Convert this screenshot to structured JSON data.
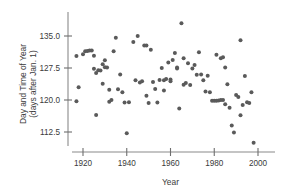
{
  "chart_data": {
    "type": "scatter",
    "title": "",
    "xlabel": "Year",
    "ylabel": "Day and Time of Year (days after Jan. 1)",
    "ylabel_line1": "Day and Time of Year",
    "ylabel_line2": "(days after Jan. 1)",
    "xlim": [
      1916,
      2001
    ],
    "ylim": [
      108.5,
      138.5
    ],
    "grid": false,
    "legend": null,
    "xticks": [
      1920,
      1940,
      1960,
      1980,
      2000
    ],
    "xtick_labels": [
      "1920",
      "1940",
      "1960",
      "1980",
      "2000"
    ],
    "yticks": [
      112.5,
      120.0,
      127.5,
      135.0
    ],
    "ytick_labels": [
      "112.5",
      "120.0",
      "127.5",
      "135.0"
    ],
    "marker": "circle",
    "marker_color": "#5a5a5a",
    "marker_size": 2.0,
    "points": [
      {
        "x": 1917,
        "y": 130.3
      },
      {
        "x": 1917,
        "y": 119.7
      },
      {
        "x": 1918,
        "y": 123.0
      },
      {
        "x": 1920,
        "y": 130.7
      },
      {
        "x": 1921,
        "y": 131.4
      },
      {
        "x": 1922,
        "y": 131.5
      },
      {
        "x": 1923,
        "y": 131.6
      },
      {
        "x": 1924,
        "y": 131.6
      },
      {
        "x": 1925,
        "y": 130.4
      },
      {
        "x": 1925,
        "y": 127.3
      },
      {
        "x": 1926,
        "y": 126.3
      },
      {
        "x": 1926,
        "y": 116.5
      },
      {
        "x": 1927,
        "y": 127.0
      },
      {
        "x": 1928,
        "y": 126.9
      },
      {
        "x": 1929,
        "y": 128.4
      },
      {
        "x": 1929,
        "y": 123.8
      },
      {
        "x": 1930,
        "y": 129.3
      },
      {
        "x": 1930,
        "y": 127.7
      },
      {
        "x": 1931,
        "y": 127.6
      },
      {
        "x": 1932,
        "y": 122.4
      },
      {
        "x": 1932,
        "y": 119.6
      },
      {
        "x": 1933,
        "y": 120.0
      },
      {
        "x": 1934,
        "y": 131.4
      },
      {
        "x": 1935,
        "y": 134.6
      },
      {
        "x": 1936,
        "y": 122.5
      },
      {
        "x": 1937,
        "y": 126.0
      },
      {
        "x": 1938,
        "y": 121.8
      },
      {
        "x": 1939,
        "y": 119.4
      },
      {
        "x": 1940,
        "y": 112.2
      },
      {
        "x": 1941,
        "y": 119.5
      },
      {
        "x": 1943,
        "y": 133.6
      },
      {
        "x": 1944,
        "y": 124.6
      },
      {
        "x": 1945,
        "y": 135.0
      },
      {
        "x": 1946,
        "y": 124.1
      },
      {
        "x": 1947,
        "y": 124.4
      },
      {
        "x": 1948,
        "y": 132.8
      },
      {
        "x": 1949,
        "y": 132.8
      },
      {
        "x": 1949,
        "y": 121.0
      },
      {
        "x": 1950,
        "y": 119.3
      },
      {
        "x": 1951,
        "y": 131.8
      },
      {
        "x": 1952,
        "y": 124.2
      },
      {
        "x": 1953,
        "y": 122.6
      },
      {
        "x": 1954,
        "y": 119.4
      },
      {
        "x": 1955,
        "y": 124.7
      },
      {
        "x": 1956,
        "y": 127.5
      },
      {
        "x": 1957,
        "y": 124.6
      },
      {
        "x": 1957,
        "y": 122.2
      },
      {
        "x": 1958,
        "y": 124.9
      },
      {
        "x": 1959,
        "y": 128.8
      },
      {
        "x": 1960,
        "y": 124.8
      },
      {
        "x": 1960,
        "y": 124.4
      },
      {
        "x": 1961,
        "y": 129.4
      },
      {
        "x": 1962,
        "y": 131.0
      },
      {
        "x": 1963,
        "y": 127.6
      },
      {
        "x": 1963,
        "y": 127.4
      },
      {
        "x": 1964,
        "y": 118.0
      },
      {
        "x": 1965,
        "y": 138.0
      },
      {
        "x": 1966,
        "y": 129.8
      },
      {
        "x": 1966,
        "y": 123.6
      },
      {
        "x": 1967,
        "y": 124.0
      },
      {
        "x": 1968,
        "y": 128.6
      },
      {
        "x": 1969,
        "y": 123.5
      },
      {
        "x": 1970,
        "y": 127.4
      },
      {
        "x": 1971,
        "y": 128.2
      },
      {
        "x": 1972,
        "y": 125.9
      },
      {
        "x": 1973,
        "y": 131.2
      },
      {
        "x": 1974,
        "y": 126.0
      },
      {
        "x": 1975,
        "y": 124.6
      },
      {
        "x": 1976,
        "y": 122.0
      },
      {
        "x": 1977,
        "y": 125.7
      },
      {
        "x": 1978,
        "y": 121.8
      },
      {
        "x": 1979,
        "y": 119.8
      },
      {
        "x": 1980,
        "y": 119.8
      },
      {
        "x": 1981,
        "y": 119.8
      },
      {
        "x": 1981,
        "y": 130.6
      },
      {
        "x": 1982,
        "y": 119.9
      },
      {
        "x": 1983,
        "y": 120.0
      },
      {
        "x": 1983,
        "y": 129.8
      },
      {
        "x": 1984,
        "y": 120.0
      },
      {
        "x": 1984,
        "y": 130.0
      },
      {
        "x": 1985,
        "y": 119.0
      },
      {
        "x": 1985,
        "y": 127.6
      },
      {
        "x": 1986,
        "y": 123.7
      },
      {
        "x": 1987,
        "y": 118.2
      },
      {
        "x": 1988,
        "y": 114.0
      },
      {
        "x": 1989,
        "y": 112.4
      },
      {
        "x": 1990,
        "y": 121.2
      },
      {
        "x": 1991,
        "y": 120.7
      },
      {
        "x": 1992,
        "y": 134.0
      },
      {
        "x": 1992,
        "y": 116.4
      },
      {
        "x": 1993,
        "y": 118.8
      },
      {
        "x": 1994,
        "y": 125.6
      },
      {
        "x": 1995,
        "y": 119.5
      },
      {
        "x": 1996,
        "y": 119.3
      },
      {
        "x": 1997,
        "y": 121.8
      },
      {
        "x": 1998,
        "y": 110.0
      }
    ]
  }
}
